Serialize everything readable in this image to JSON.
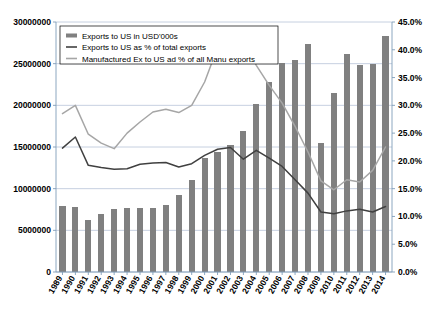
{
  "chart_data": {
    "type": "bar",
    "title": "",
    "xlabel": "",
    "ylabel": "",
    "y2label": "",
    "grid": true,
    "legend_position": "top-left",
    "categories": [
      "1989",
      "1990",
      "1991",
      "1992",
      "1993",
      "1994",
      "1995",
      "1996",
      "1997",
      "1998",
      "1999",
      "2000",
      "2001",
      "2002",
      "2003",
      "2004",
      "2005",
      "2006",
      "2007",
      "2008",
      "2009",
      "2010",
      "2011",
      "2012",
      "2013",
      "2014"
    ],
    "ylim": [
      0,
      30000000
    ],
    "yticks": [
      0,
      5000000,
      10000000,
      15000000,
      20000000,
      25000000,
      30000000
    ],
    "ytick_labels": [
      "0",
      "5000000",
      "10000000",
      "15000000",
      "20000000",
      "25000000",
      "30000000"
    ],
    "y2lim": [
      0,
      0.45
    ],
    "y2ticks": [
      0,
      0.05,
      0.1,
      0.15,
      0.2,
      0.25,
      0.3,
      0.35,
      0.4,
      0.45
    ],
    "y2tick_labels": [
      "0.0%",
      "5.0%",
      "10.0%",
      "15.0%",
      "20.0%",
      "25.0%",
      "30.0%",
      "35.0%",
      "40.0%",
      "45.0%"
    ],
    "series": [
      {
        "name": "Exports to US in USD'000s",
        "type": "bar",
        "axis": "left",
        "color": "#808080",
        "values": [
          7900000,
          7800000,
          6300000,
          7000000,
          7600000,
          7700000,
          7700000,
          7700000,
          8100000,
          9200000,
          11000000,
          13700000,
          14400000,
          15200000,
          16900000,
          20200000,
          22800000,
          25100000,
          25500000,
          27400000,
          15500000,
          21500000,
          26200000,
          24900000,
          25000000,
          28300000
        ]
      },
      {
        "name": "Exports to US as % of total exports",
        "type": "line",
        "axis": "right",
        "color": "#404040",
        "values": [
          0.223,
          0.243,
          0.192,
          0.188,
          0.185,
          0.186,
          0.194,
          0.196,
          0.197,
          0.189,
          0.195,
          0.21,
          0.221,
          0.224,
          0.203,
          0.219,
          0.205,
          0.19,
          0.166,
          0.142,
          0.108,
          0.105,
          0.11,
          0.113,
          0.108,
          0.118
        ]
      },
      {
        "name": "Manufactured Ex to US ad % of all Manu exports",
        "type": "line",
        "axis": "right",
        "color": "#a6a6a6",
        "values": [
          0.285,
          0.3,
          0.248,
          0.232,
          0.222,
          0.25,
          0.27,
          0.288,
          0.293,
          0.287,
          0.3,
          0.342,
          0.404,
          0.425,
          0.418,
          0.372,
          0.336,
          0.304,
          0.262,
          0.216,
          0.164,
          0.148,
          0.166,
          0.162,
          0.183,
          0.225
        ]
      }
    ],
    "legend": [
      {
        "label": "Exports to US in USD'000s",
        "marker": "bar",
        "color": "#808080"
      },
      {
        "label": "Exports to US as % of total exports",
        "marker": "line",
        "color": "#404040"
      },
      {
        "label": "Manufactured Ex to US ad % of all Manu exports",
        "marker": "line",
        "color": "#a6a6a6"
      }
    ]
  }
}
